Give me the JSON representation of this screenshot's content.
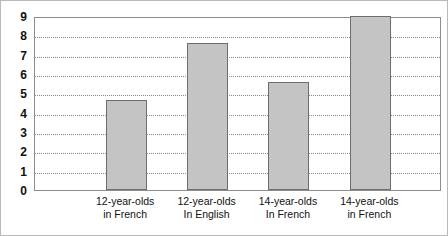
{
  "chart_data": {
    "type": "bar",
    "title": "",
    "subtitle": "",
    "xlabel": "",
    "ylabel": "",
    "ylim": [
      0,
      9
    ],
    "grid": true,
    "legend": "none",
    "ytick_labels": [
      "9",
      "8",
      "7",
      "6",
      "5",
      "4",
      "3",
      "2",
      "1",
      "0"
    ],
    "yticks": [
      9,
      8,
      7,
      6,
      5,
      4,
      3,
      2,
      1,
      0
    ],
    "categories": [
      "12-year-olds in French",
      "12-year-olds In English",
      "14-year-olds In French",
      "14-year-olds in French"
    ],
    "category_lines": [
      [
        "12-year-olds",
        "in French"
      ],
      [
        "12-year-olds",
        "In English"
      ],
      [
        "14-year-olds",
        "In French"
      ],
      [
        "14-year-olds",
        "in French"
      ]
    ],
    "values": [
      4.65,
      7.6,
      5.6,
      9.0
    ],
    "bar_color": "#c4c4c4",
    "bar_border_color": "#6e6e6e",
    "gridline_color": "#8a8a8a",
    "axis_color": "#8d8d8d",
    "frame_color": "#b9b9b9"
  }
}
